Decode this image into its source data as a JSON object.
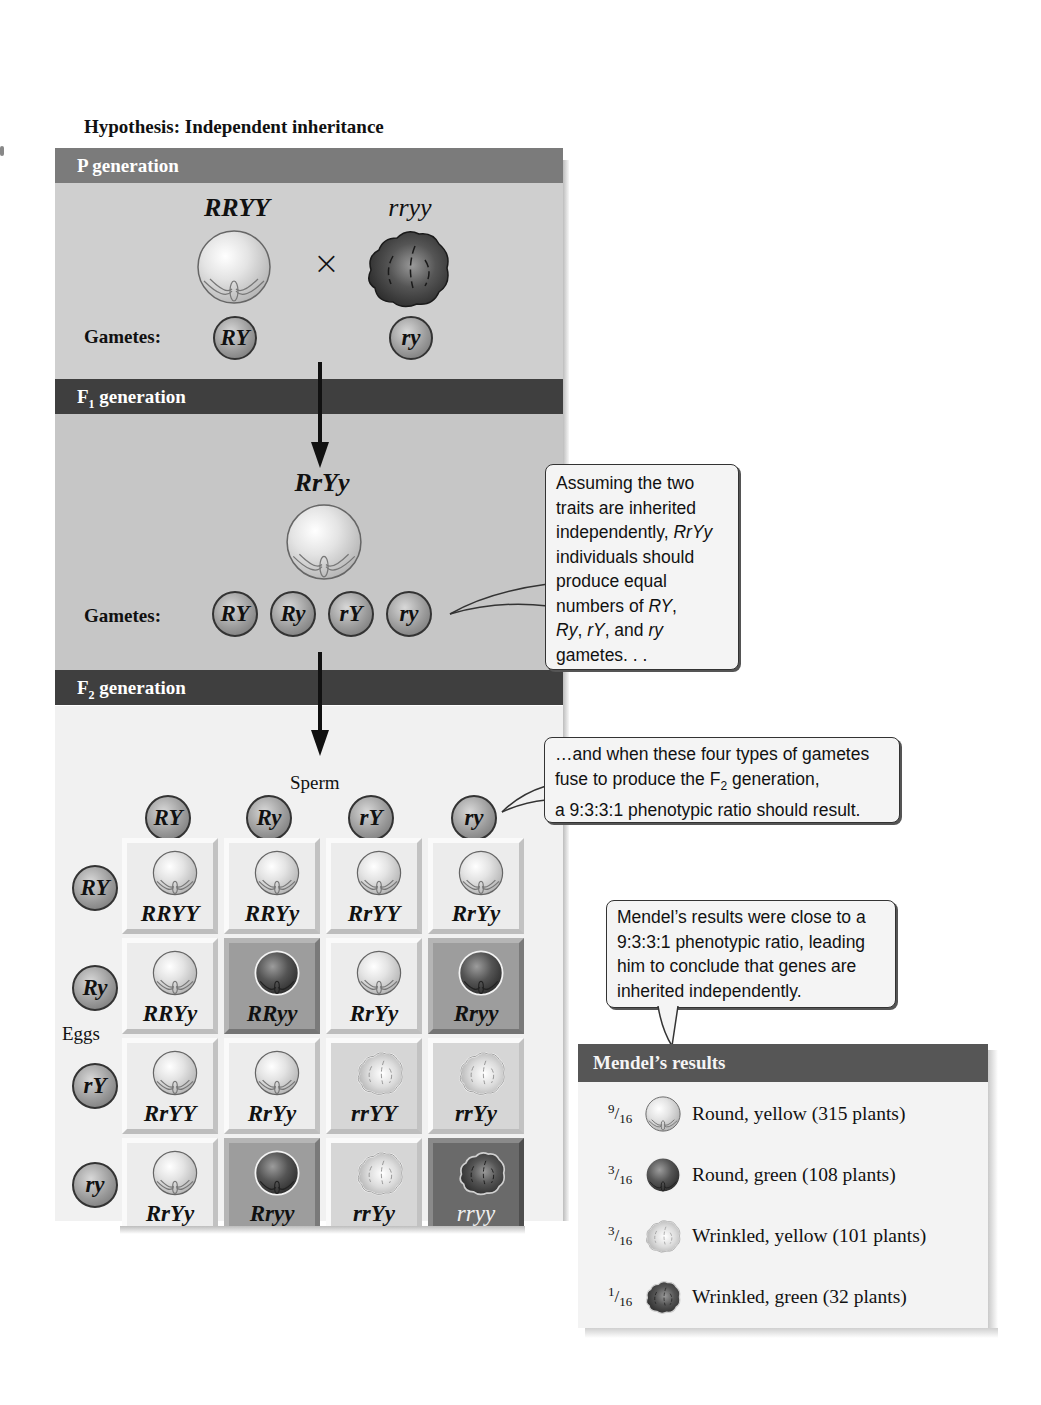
{
  "figure": {
    "title": "Hypothesis: Independent inheritance"
  },
  "p_generation": {
    "header": "P generation",
    "parent1_genotype": "RRYY",
    "parent1_phenotype": "round-yellow",
    "cross_symbol": "×",
    "parent2_genotype": "rryy",
    "parent2_phenotype": "wrinkled-green",
    "gametes_label": "Gametes:",
    "gametes": [
      "RY",
      "ry"
    ]
  },
  "f1_generation": {
    "header_prefix": "F",
    "header_sub": "1",
    "header_suffix": " generation",
    "genotype": "RrYy",
    "phenotype": "round-yellow",
    "gametes_label": "Gametes:",
    "gametes": [
      "RY",
      "Ry",
      "rY",
      "ry"
    ]
  },
  "callout_f1": {
    "lines": [
      "Assuming the two",
      "traits are inherited",
      "independently, ",
      "individuals should",
      "produce equal",
      "numbers of ",
      ", ",
      "gametes. . ."
    ],
    "italic_terms": [
      "RrYy",
      "RY",
      "Ry",
      "rY",
      "ry"
    ],
    "text_parts": {
      "l1": "Assuming the two",
      "l2": "traits are inherited",
      "l3a": "independently, ",
      "l3b": "RrYy",
      "l4": "individuals should",
      "l5": "produce equal",
      "l6a": "numbers of ",
      "l6b": "RY",
      "l6c": ",",
      "l7a": "Ry",
      "l7b": ", ",
      "l7c": "rY",
      "l7d": ", and ",
      "l7e": "ry",
      "l8": "gametes. . ."
    }
  },
  "f2_generation": {
    "header_prefix": "F",
    "header_sub": "2",
    "header_suffix": " generation",
    "sperm_label": "Sperm",
    "eggs_label": "Eggs",
    "sperm_gametes": [
      "RY",
      "Ry",
      "rY",
      "ry"
    ],
    "egg_gametes": [
      "RY",
      "Ry",
      "rY",
      "ry"
    ],
    "punnett": [
      [
        {
          "genotype": "RRYY",
          "phenotype": "round-yellow"
        },
        {
          "genotype": "RRYy",
          "phenotype": "round-yellow"
        },
        {
          "genotype": "RrYY",
          "phenotype": "round-yellow"
        },
        {
          "genotype": "RrYy",
          "phenotype": "round-yellow"
        }
      ],
      [
        {
          "genotype": "RRYy",
          "phenotype": "round-yellow"
        },
        {
          "genotype": "RRyy",
          "phenotype": "round-green"
        },
        {
          "genotype": "RrYy",
          "phenotype": "round-yellow"
        },
        {
          "genotype": "Rryy",
          "phenotype": "round-green"
        }
      ],
      [
        {
          "genotype": "RrYY",
          "phenotype": "round-yellow"
        },
        {
          "genotype": "RrYy",
          "phenotype": "round-yellow"
        },
        {
          "genotype": "rrYY",
          "phenotype": "wrinkled-yellow"
        },
        {
          "genotype": "rrYy",
          "phenotype": "wrinkled-yellow"
        }
      ],
      [
        {
          "genotype": "RrYy",
          "phenotype": "round-yellow"
        },
        {
          "genotype": "Rryy",
          "phenotype": "round-green"
        },
        {
          "genotype": "rrYy",
          "phenotype": "wrinkled-yellow"
        },
        {
          "genotype": "rryy",
          "phenotype": "wrinkled-green"
        }
      ]
    ]
  },
  "callout_f2": {
    "l1": "…and when these four types of gametes",
    "l2a": "fuse to produce the F",
    "l2sub": "2",
    "l2b": " generation,",
    "l3": "a 9:3:3:1 phenotypic ratio should result."
  },
  "callout_results": {
    "l1": "Mendel’s results were close to a",
    "l2": "9:3:3:1 phenotypic ratio, leading",
    "l3": "him to conclude that genes are",
    "l4": "inherited independently."
  },
  "results": {
    "header": "Mendel’s results",
    "rows": [
      {
        "num": "9",
        "den": "16",
        "phenotype": "round-yellow",
        "label": "Round, yellow (315 plants)"
      },
      {
        "num": "3",
        "den": "16",
        "phenotype": "round-green",
        "label": "Round, green (108 plants)"
      },
      {
        "num": "3",
        "den": "16",
        "phenotype": "wrinkled-yellow",
        "label": "Wrinkled, yellow (101 plants)"
      },
      {
        "num": "1",
        "den": "16",
        "phenotype": "wrinkled-green",
        "label": "Wrinkled, green (32 plants)"
      }
    ]
  }
}
